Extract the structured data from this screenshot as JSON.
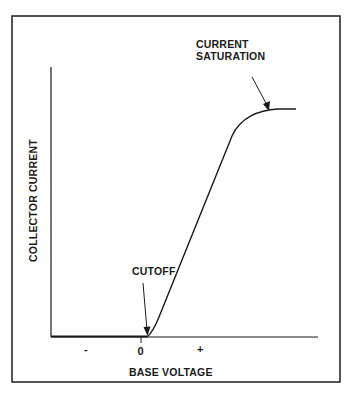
{
  "diagram": {
    "x_axis_label": "BASE VOLTAGE",
    "y_axis_label": "COLLECTOR CURRENT",
    "x_ticks": [
      {
        "label": "-",
        "x": 87
      },
      {
        "label": "0",
        "x": 141
      },
      {
        "label": "+",
        "x": 200
      }
    ],
    "annotations": [
      {
        "id": "cutoff",
        "text": "CUTOFF"
      },
      {
        "id": "saturation",
        "line1": "CURRENT",
        "line2": "SATURATION"
      }
    ],
    "regions": [
      "cutoff",
      "linear",
      "current saturation"
    ],
    "colors": {
      "line": "#1a1a1a",
      "background": "#ffffff",
      "frame": "#2a2a2a"
    }
  }
}
